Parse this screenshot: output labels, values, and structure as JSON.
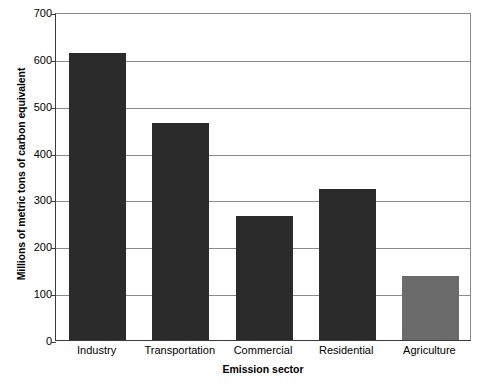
{
  "chart_data": {
    "type": "bar",
    "title": "",
    "xlabel": "Emission sector",
    "ylabel": "Millions of metric tons of carbon equivalent",
    "categories": [
      "Industry",
      "Transportation",
      "Commercial",
      "Residential",
      "Agriculture"
    ],
    "values": [
      612,
      463,
      265,
      323,
      136
    ],
    "ylim": [
      0,
      700
    ],
    "ytick_values": [
      0,
      100,
      200,
      300,
      400,
      500,
      600,
      700
    ],
    "ytick_labels": [
      "0",
      "100",
      "200",
      "300",
      "400",
      "500",
      "600",
      "700"
    ],
    "grid": true,
    "legend": "none",
    "bar_colors": [
      "#2b2b2b",
      "#2b2b2b",
      "#2b2b2b",
      "#2b2b2b",
      "#6b6b6b"
    ],
    "gridline_color": "#8a8a8a",
    "axis_color": "#3a3a3a",
    "background_color": "#ffffff"
  }
}
